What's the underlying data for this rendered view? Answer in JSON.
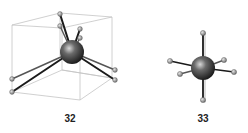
{
  "figure": {
    "structures": [
      {
        "id": "structure-32",
        "label": "32",
        "description": "Central atom with six ligands inside a wireframe cube (trigonal-prismatic-like arrangement)"
      },
      {
        "id": "structure-33",
        "label": "33",
        "description": "Central atom with six ligands in octahedral arrangement"
      }
    ],
    "colors": {
      "central_atom": "#3a3a3a",
      "ligand_atom": "#9a9a9a",
      "bond": "#1a1a1a",
      "cube_edge": "#bdbdbd",
      "label": "#222222"
    }
  }
}
